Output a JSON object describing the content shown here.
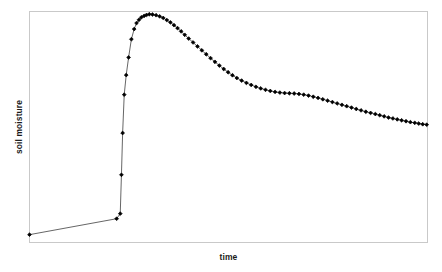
{
  "chart_data": {
    "type": "line",
    "title": "",
    "subtitle": "",
    "xlabel": "time",
    "ylabel": "soil moisture",
    "grid": false,
    "legend": null,
    "marker": "diamond",
    "marker_color": "#000000",
    "line_color": "#555555",
    "frame_color": "#c9c9c9",
    "axis_ticks": false,
    "tick_labels": {
      "x": [],
      "y": []
    },
    "xlim": [
      0,
      1
    ],
    "ylim": [
      0,
      1
    ],
    "series": [
      {
        "name": "soil moisture",
        "x": [
          0.0,
          0.219,
          0.228,
          0.231,
          0.234,
          0.238,
          0.243,
          0.249,
          0.256,
          0.263,
          0.269,
          0.275,
          0.281,
          0.288,
          0.294,
          0.301,
          0.309,
          0.318,
          0.327,
          0.336,
          0.345,
          0.354,
          0.363,
          0.372,
          0.381,
          0.39,
          0.4,
          0.411,
          0.422,
          0.433,
          0.444,
          0.455,
          0.466,
          0.477,
          0.488,
          0.499,
          0.51,
          0.521,
          0.533,
          0.545,
          0.557,
          0.569,
          0.581,
          0.593,
          0.605,
          0.617,
          0.629,
          0.641,
          0.653,
          0.665,
          0.677,
          0.689,
          0.701,
          0.713,
          0.725,
          0.737,
          0.749,
          0.761,
          0.773,
          0.785,
          0.797,
          0.809,
          0.821,
          0.833,
          0.845,
          0.857,
          0.869,
          0.88,
          0.891,
          0.902,
          0.913,
          0.924,
          0.935,
          0.946,
          0.957,
          0.968,
          0.978,
          0.988,
          0.998
        ],
        "y": [
          0.034,
          0.103,
          0.125,
          0.293,
          0.474,
          0.64,
          0.725,
          0.801,
          0.88,
          0.924,
          0.95,
          0.964,
          0.975,
          0.981,
          0.985,
          0.988,
          0.987,
          0.984,
          0.979,
          0.972,
          0.963,
          0.953,
          0.941,
          0.928,
          0.914,
          0.899,
          0.883,
          0.866,
          0.849,
          0.832,
          0.815,
          0.798,
          0.782,
          0.766,
          0.751,
          0.737,
          0.724,
          0.712,
          0.701,
          0.691,
          0.682,
          0.674,
          0.667,
          0.661,
          0.656,
          0.652,
          0.649,
          0.647,
          0.646,
          0.645,
          0.643,
          0.64,
          0.636,
          0.631,
          0.626,
          0.62,
          0.614,
          0.608,
          0.602,
          0.596,
          0.59,
          0.584,
          0.578,
          0.572,
          0.566,
          0.561,
          0.556,
          0.551,
          0.546,
          0.541,
          0.537,
          0.533,
          0.529,
          0.525,
          0.521,
          0.518,
          0.515,
          0.512,
          0.51
        ]
      }
    ],
    "marker_visible_x": [
      0.0,
      0.219,
      0.228,
      0.231,
      0.234,
      0.238,
      0.243,
      0.249,
      0.256,
      0.263,
      0.269,
      0.275,
      0.281,
      0.288,
      0.294,
      0.301,
      0.309,
      0.318,
      0.327,
      0.336,
      0.345,
      0.354,
      0.363,
      0.372,
      0.381,
      0.39,
      0.4,
      0.411,
      0.422,
      0.433,
      0.444,
      0.455,
      0.466,
      0.477,
      0.488,
      0.499,
      0.51,
      0.521,
      0.533,
      0.545,
      0.557,
      0.569,
      0.581,
      0.593,
      0.605,
      0.617,
      0.629,
      0.641,
      0.653,
      0.665,
      0.677,
      0.689,
      0.701,
      0.713,
      0.725,
      0.737,
      0.749,
      0.761,
      0.773,
      0.785,
      0.797,
      0.809,
      0.821,
      0.833,
      0.845,
      0.857,
      0.869,
      0.88,
      0.891,
      0.902,
      0.913,
      0.924,
      0.935,
      0.946,
      0.957,
      0.968,
      0.978,
      0.988,
      0.998
    ]
  },
  "axes": {
    "x_title": "time",
    "y_title": "soil moisture"
  }
}
